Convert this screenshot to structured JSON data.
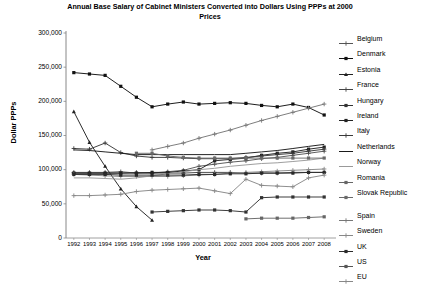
{
  "chart_data": {
    "type": "line",
    "title": "Annual Base Salary of Cabinet Ministers Converted into Dollars Using PPPs at 2000 Prices",
    "xlabel": "Year",
    "ylabel": "Dollar PPPs",
    "categories": [
      1992,
      1993,
      1994,
      1995,
      1996,
      1997,
      1998,
      1999,
      2000,
      2001,
      2002,
      2003,
      2004,
      2005,
      2006,
      2007,
      2008
    ],
    "x": [
      "1992",
      "1993",
      "1994",
      "1995",
      "1996",
      "1997",
      "1998",
      "1999",
      "2000",
      "2001",
      "2002",
      "2003",
      "2004",
      "2005",
      "2006",
      "2007",
      "2008"
    ],
    "ylim": [
      0,
      300000
    ],
    "ytick_values": [
      0,
      50000,
      100000,
      150000,
      200000,
      250000,
      300000
    ],
    "ytick_labels": [
      "0",
      "50,000",
      "100,000",
      "150,000",
      "200,000",
      "250,000",
      "300,000"
    ],
    "grid": false,
    "legend_position": "right",
    "series": [
      {
        "name": "Belgium",
        "marker": "plus",
        "color": "#555555",
        "values": [
          96000,
          96000,
          96000,
          97000,
          95000,
          95000,
          97000,
          99000,
          105000,
          108000,
          111000,
          113000,
          116000,
          118000,
          121000,
          124000,
          127000
        ]
      },
      {
        "name": "Denmark",
        "marker": "square",
        "color": "#111111",
        "values": [
          242000,
          240000,
          238000,
          222000,
          206000,
          192000,
          196000,
          199000,
          196000,
          197000,
          198000,
          197000,
          194000,
          192000,
          196000,
          191000,
          180000
        ]
      },
      {
        "name": "Estonia",
        "marker": "triangle",
        "color": "#222222",
        "values": [
          185000,
          140000,
          105000,
          72000,
          46000,
          26000,
          null,
          null,
          null,
          null,
          null,
          null,
          null,
          null,
          null,
          null,
          null
        ]
      },
      {
        "name": "France",
        "marker": "plus",
        "color": "#444444",
        "values": [
          95000,
          95000,
          95000,
          95000,
          96000,
          95000,
          95000,
          95000,
          96000,
          96000,
          96000,
          95000,
          95000,
          95000,
          96000,
          96000,
          96000
        ]
      },
      {
        "name": "Hungary",
        "marker": "square",
        "color": "#333333",
        "values": [
          null,
          null,
          null,
          null,
          null,
          38000,
          39000,
          40000,
          41000,
          41000,
          40000,
          38000,
          59000,
          60000,
          60000,
          60000,
          60000
        ]
      },
      {
        "name": "Ireland",
        "marker": "square",
        "color": "#222222",
        "values": [
          95000,
          95000,
          95000,
          95000,
          95000,
          96000,
          96000,
          98000,
          100000,
          113000,
          115000,
          117000,
          121000,
          124000,
          126000,
          130000,
          133000
        ]
      },
      {
        "name": "Italy",
        "marker": "plus",
        "color": "#3a3a3a",
        "values": [
          131000,
          130000,
          139000,
          125000,
          120000,
          118000,
          118000,
          117000,
          116000,
          116000,
          116000,
          118000,
          120000,
          122000,
          124000,
          127000,
          130000
        ]
      },
      {
        "name": "Netherlands",
        "marker": "line",
        "color": "#1a1a1a",
        "values": [
          129000,
          128000,
          126000,
          124000,
          122000,
          122000,
          122000,
          122000,
          122000,
          122000,
          122000,
          124000,
          126000,
          128000,
          131000,
          134000,
          137000
        ]
      },
      {
        "name": "Norway",
        "marker": "line",
        "color": "#999999",
        "values": [
          88000,
          88000,
          87000,
          86000,
          88000,
          91000,
          94000,
          97000,
          100000,
          102000,
          105000,
          107000,
          109000,
          110000,
          112000,
          114000,
          117000
        ]
      },
      {
        "name": "Romania",
        "marker": "square",
        "color": "#666666",
        "values": [
          null,
          null,
          null,
          null,
          null,
          null,
          null,
          null,
          null,
          null,
          null,
          28000,
          29000,
          29000,
          29000,
          30000,
          31000
        ]
      },
      {
        "name": "Slovak Republic",
        "marker": "square",
        "color": "#6a6a6a",
        "values": [
          null,
          null,
          null,
          null,
          124000,
          124000,
          120000,
          118000,
          117000,
          117000,
          117000,
          117000,
          117000,
          117000,
          117000,
          117000,
          117000
        ]
      },
      {
        "name": "Spain",
        "marker": "plus",
        "color": "#777777",
        "values": [
          null,
          null,
          null,
          null,
          null,
          129000,
          134000,
          139000,
          146000,
          152000,
          158000,
          165000,
          172000,
          178000,
          184000,
          190000,
          196000
        ]
      },
      {
        "name": "Sweden",
        "marker": "plus",
        "color": "#888888",
        "values": [
          93000,
          92000,
          91000,
          90000,
          90000,
          90000,
          90000,
          91000,
          92000,
          93000,
          95000,
          96000,
          97000,
          98000,
          99000,
          100000,
          101000
        ]
      },
      {
        "name": "UK",
        "marker": "square",
        "color": "#2a2a2a",
        "values": [
          93000,
          93000,
          93000,
          92000,
          92000,
          92000,
          92000,
          92000,
          93000,
          93000,
          94000,
          94000,
          95000,
          95000,
          95000,
          96000,
          96000
        ]
      },
      {
        "name": "US",
        "marker": "square",
        "color": "#555555",
        "values": [
          null,
          null,
          null,
          null,
          null,
          null,
          null,
          null,
          null,
          null,
          null,
          null,
          null,
          null,
          null,
          null,
          null
        ]
      },
      {
        "name": "EU",
        "marker": "plus",
        "color": "#888888",
        "values": [
          62000,
          62000,
          63000,
          64000,
          68000,
          70000,
          71000,
          72000,
          73000,
          69000,
          65000,
          86000,
          77000,
          76000,
          75000,
          88000,
          92000
        ]
      }
    ]
  },
  "legend": {
    "items": [
      {
        "label": "Belgium",
        "marker": "plus"
      },
      {
        "label": "Denmark",
        "marker": "square"
      },
      {
        "label": "Estonia",
        "marker": "triangle"
      },
      {
        "label": "France",
        "marker": "plus"
      },
      {
        "label": "Hungary",
        "marker": "square"
      },
      {
        "label": "Ireland",
        "marker": "square"
      },
      {
        "label": "Italy",
        "marker": "plus"
      },
      {
        "label": "Netherlands",
        "marker": "line"
      },
      {
        "label": "Norway",
        "marker": "line"
      },
      {
        "label": "Romania",
        "marker": "square"
      },
      {
        "label": "Slovak Republic",
        "marker": "square"
      },
      {
        "label": "Spain",
        "marker": "plus"
      },
      {
        "label": "Sweden",
        "marker": "plus"
      },
      {
        "label": "UK",
        "marker": "square"
      },
      {
        "label": "US",
        "marker": "square"
      },
      {
        "label": "EU",
        "marker": "plus"
      }
    ]
  }
}
